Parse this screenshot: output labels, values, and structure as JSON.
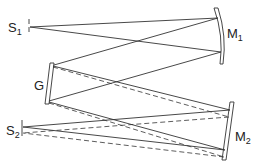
{
  "diagram": {
    "type": "Czerny-Turner monochromator optical layout",
    "labels": {
      "entrance_slit": {
        "main": "S",
        "sub": "1"
      },
      "collimating_mirror": {
        "main": "M",
        "sub": "1"
      },
      "grating": {
        "main": "G",
        "sub": ""
      },
      "focusing_mirror": {
        "main": "M",
        "sub": "2"
      },
      "exit_slit": {
        "main": "S",
        "sub": "2"
      }
    },
    "ray_styles": [
      "solid",
      "dashed"
    ],
    "colors": {
      "line": "#333333",
      "background": "#ffffff"
    }
  }
}
